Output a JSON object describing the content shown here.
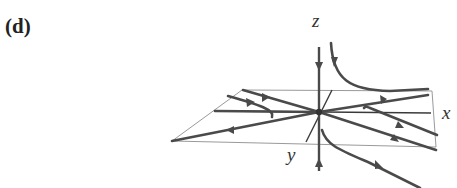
{
  "figure": {
    "panel_label": "(d)",
    "axes": {
      "x_label": "x",
      "y_label": "y",
      "z_label": "z"
    },
    "colors": {
      "trajectory": "#4a4a4a",
      "axis": "#3a3a3a",
      "plane": "#9a9a9a",
      "origin": "#333333"
    }
  }
}
